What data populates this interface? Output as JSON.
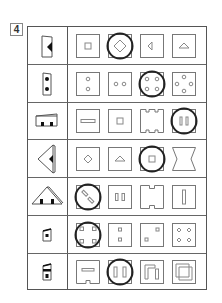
{
  "question": {
    "number": "4"
  },
  "colors": {
    "line": "#555555",
    "shape": "#777777",
    "fill": "#111111",
    "circle": "#222222"
  },
  "rows": [
    {
      "reference": "flap-panel-with-left-triangle",
      "options": [
        "small-square",
        "diamond",
        "left-triangle",
        "up-triangle"
      ],
      "selected_index": 1
    },
    {
      "reference": "flap-panel-with-two-dots-vertical",
      "options": [
        "two-circles-vertical",
        "two-circles-horizontal",
        "four-circles-corners",
        "four-circles-sides"
      ],
      "selected_index": 2
    },
    {
      "reference": "box-with-two-bottom-notches",
      "options": [
        "horizontal-bar",
        "small-square",
        "notched-square-four-notches",
        "two-vertical-bars"
      ],
      "selected_index": 3
    },
    {
      "reference": "arrowhead-with-left-triangle",
      "options": [
        "diamond",
        "up-triangle",
        "small-square",
        "hourglass-notched-sides"
      ],
      "selected_index": 2
    },
    {
      "reference": "triangle-with-two-bottom-squares",
      "options": [
        "two-diagonal-bars",
        "two-vertical-small-bars",
        "notched-square-top-bottom",
        "single-vertical-bar"
      ],
      "selected_index": 0
    },
    {
      "reference": "flap-panel-with-center-square",
      "options": [
        "four-squares-corners",
        "two-squares-vertical",
        "two-squares-diagonal",
        "four-diamonds"
      ],
      "selected_index": 0
    },
    {
      "reference": "flap-panel-with-bar-and-square",
      "options": [
        "bar-with-bottom-notch",
        "two-vertical-bars-wide",
        "corner-bracket-with-bar",
        "spiral-square"
      ],
      "selected_index": 1
    }
  ]
}
